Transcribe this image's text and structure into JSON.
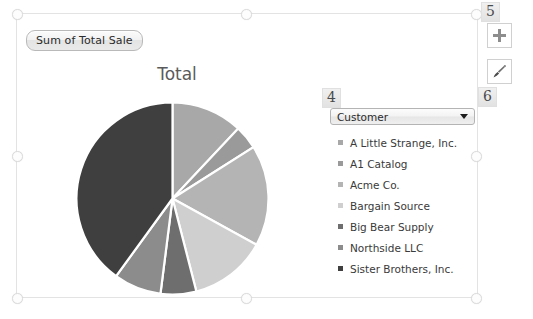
{
  "field_button": {
    "label": "Sum of Total Sale"
  },
  "chart": {
    "title": "Total"
  },
  "filter": {
    "label": "Customer",
    "caret_icon": "chevron-down-icon"
  },
  "legend": {
    "items": [
      {
        "label": "A Little Strange, Inc.",
        "color": "#a8a8a8"
      },
      {
        "label": "A1 Catalog",
        "color": "#9a9a9a"
      },
      {
        "label": "Acme Co.",
        "color": "#b4b4b4"
      },
      {
        "label": "Bargain Source",
        "color": "#cfcfcf"
      },
      {
        "label": "Big Bear Supply",
        "color": "#6e6e6e"
      },
      {
        "label": "Northside LLC",
        "color": "#8c8c8c"
      },
      {
        "label": "Sister Brothers, Inc.",
        "color": "#3f3f3f"
      }
    ]
  },
  "side_buttons": [
    {
      "name": "chart-elements-button",
      "icon": "plus-icon"
    },
    {
      "name": "chart-styles-button",
      "icon": "paintbrush-icon"
    }
  ],
  "callouts": {
    "four": "4",
    "five": "5",
    "six": "6"
  },
  "chart_data": {
    "type": "pie",
    "title": "Total",
    "legend_position": "right",
    "categories": [
      "A Little Strange, Inc.",
      "A1 Catalog",
      "Acme Co.",
      "Bargain Source",
      "Big Bear Supply",
      "Northside LLC",
      "Sister Brothers, Inc."
    ],
    "values": [
      12,
      4,
      17,
      13,
      6,
      8,
      40
    ],
    "unit": "percent",
    "colors": [
      "#a8a8a8",
      "#9a9a9a",
      "#b4b4b4",
      "#cfcfcf",
      "#6e6e6e",
      "#8c8c8c",
      "#3f3f3f"
    ],
    "start_angle_deg": 0,
    "direction": "clockwise",
    "slice_border_color": "#ffffff"
  }
}
